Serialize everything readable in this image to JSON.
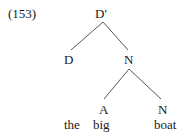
{
  "example_number": "(153)",
  "tree": {
    "root": "D'",
    "nodes": {
      "d": "D",
      "n1": "N",
      "a": "A",
      "n2": "N"
    },
    "words": [
      "the",
      "big",
      "boat"
    ]
  },
  "colors": {
    "ink": "#1a1a1a",
    "line": "#444444"
  }
}
